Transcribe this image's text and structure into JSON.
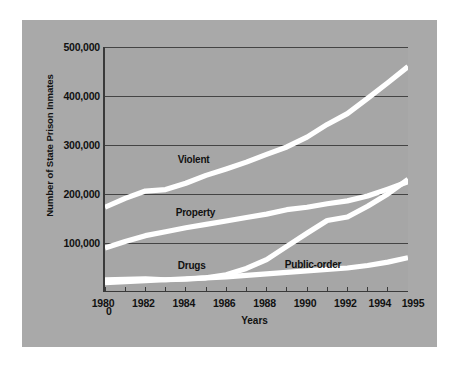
{
  "chart_data": {
    "type": "line",
    "title": "",
    "xlabel": "Years",
    "ylabel": "Number of State Prison Inmates",
    "x": [
      1980,
      1981,
      1982,
      1983,
      1984,
      1985,
      1986,
      1987,
      1988,
      1989,
      1990,
      1991,
      1992,
      1993,
      1994,
      1995
    ],
    "xlim": [
      1980,
      1995
    ],
    "ylim": [
      0,
      500000
    ],
    "grid": true,
    "legend_position": "inline-labels",
    "y_tick_labels": [
      "0",
      "100,000",
      "200,000",
      "300,000",
      "400,000",
      "500,000"
    ],
    "y_tick_values": [
      0,
      100000,
      200000,
      300000,
      400000,
      500000
    ],
    "x_tick_labels": [
      "1980",
      "1982",
      "1984",
      "1986",
      "1988",
      "1990",
      "1992",
      "1994",
      "1995"
    ],
    "x_tick_values": [
      1980,
      1982,
      1984,
      1986,
      1988,
      1990,
      1992,
      1994,
      1995
    ],
    "x_minor_ticks": [
      1980,
      1981,
      1982,
      1983,
      1984,
      1985,
      1986,
      1987,
      1988,
      1989,
      1990,
      1991,
      1992,
      1993,
      1994,
      1995
    ],
    "series": [
      {
        "name": "Violent",
        "label": "Violent",
        "color": "#ffffff",
        "label_x": 1983.6,
        "label_y": 268000,
        "values": [
          173000,
          191000,
          206000,
          209000,
          222000,
          238000,
          251000,
          265000,
          281000,
          296000,
          316000,
          342000,
          364000,
          395000,
          427000,
          460000
        ]
      },
      {
        "name": "Property",
        "label": "Property",
        "color": "#ffffff",
        "label_x": 1983.5,
        "label_y": 159000,
        "values": [
          90000,
          103000,
          115000,
          123000,
          131000,
          138000,
          145000,
          152000,
          159000,
          168000,
          173000,
          180000,
          186000,
          196000,
          210000,
          225000
        ]
      },
      {
        "name": "Drugs",
        "label": "Drugs",
        "color": "#ffffff",
        "label_x": 1983.6,
        "label_y": 52000,
        "values": [
          19000,
          21000,
          23000,
          25000,
          26000,
          29000,
          35000,
          48000,
          66000,
          93000,
          120000,
          146000,
          153000,
          175000,
          200000,
          230000
        ]
      },
      {
        "name": "Public-order",
        "label": "Public-order",
        "color": "#ffffff",
        "label_x": 1988.9,
        "label_y": 54000,
        "values": [
          25000,
          26000,
          27000,
          25000,
          27000,
          29000,
          31000,
          34000,
          37000,
          40000,
          43000,
          46000,
          49000,
          54000,
          61000,
          70000
        ]
      }
    ]
  },
  "figure": {
    "background_color": "#ffffff",
    "panel_color": "#a9a9a9",
    "plot_color": "#a6a6a6",
    "gridline_color": "#3a3a3a",
    "axis_color": "#3a3a3a",
    "line_color": "#ffffff"
  }
}
